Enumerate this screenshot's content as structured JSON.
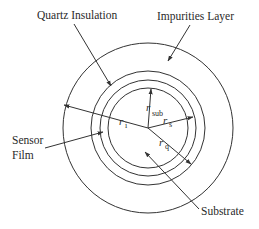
{
  "diagram": {
    "type": "concentric-cross-section",
    "colors": {
      "ink": "#333333",
      "background": "#ffffff"
    },
    "center": [
      148,
      128
    ],
    "circles": [
      {
        "name": "impurities-layer-outer",
        "r": 85
      },
      {
        "name": "quartz-insulation-outer",
        "r": 57
      },
      {
        "name": "sensor-film-outer",
        "r": 48
      },
      {
        "name": "substrate-outer",
        "r": 40
      }
    ],
    "labels": {
      "quartz": "Quartz Insulation",
      "impurities": "Impurities Layer",
      "sensor_line1": "Sensor",
      "sensor_line2": "Film",
      "substrate": "Substrate"
    },
    "radii": {
      "r_i": {
        "base": "r",
        "sub": "i"
      },
      "r_sub": {
        "base": "r",
        "sub": "sub"
      },
      "r_s": {
        "base": "r",
        "sub": "s"
      },
      "r_q": {
        "base": "r",
        "sub": "q"
      }
    }
  }
}
